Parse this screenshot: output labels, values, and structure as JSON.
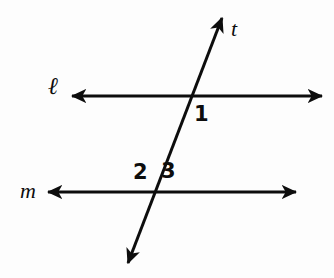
{
  "figure": {
    "background_color": "#fdfdfd",
    "stroke_color": "#0d0d0d",
    "labels": {
      "transversal": "t",
      "line_top": "ℓ",
      "line_bottom": "m",
      "angle_1": "1",
      "angle_2": "2",
      "angle_3": "3"
    }
  },
  "chart_data": {
    "type": "diagram",
    "width": 334,
    "height": 278,
    "lines": [
      {
        "name": "ℓ",
        "id": "line-ell",
        "kind": "double-arrow",
        "x1": 72,
        "y1": 96,
        "x2": 322,
        "y2": 96,
        "stroke_width": 3,
        "label": "ℓ",
        "label_x": 55,
        "label_y": 90
      },
      {
        "name": "m",
        "id": "line-m",
        "kind": "double-arrow",
        "x1": 48,
        "y1": 192,
        "x2": 296,
        "y2": 192,
        "stroke_width": 3,
        "label": "m",
        "label_x": 29,
        "label_y": 190
      },
      {
        "name": "t",
        "id": "line-t",
        "kind": "double-arrow",
        "x1": 222,
        "y1": 18,
        "x2": 128,
        "y2": 263,
        "stroke_width": 3,
        "label": "t",
        "label_x": 236,
        "label_y": 28
      }
    ],
    "intersections": [
      {
        "id": "intersection-ell-t",
        "lines": [
          "ℓ",
          "t"
        ],
        "x": 190,
        "y": 96
      },
      {
        "id": "intersection-m-t",
        "lines": [
          "m",
          "t"
        ],
        "x": 153,
        "y": 192
      }
    ],
    "angle_labels": [
      {
        "text": "1",
        "x": 200,
        "y": 114,
        "at_intersection": "intersection-ell-t",
        "position": "below-right"
      },
      {
        "text": "2",
        "x": 141,
        "y": 172,
        "at_intersection": "intersection-m-t",
        "position": "above-left"
      },
      {
        "text": "3",
        "x": 169,
        "y": 171,
        "at_intersection": "intersection-m-t",
        "position": "above-right"
      }
    ]
  }
}
